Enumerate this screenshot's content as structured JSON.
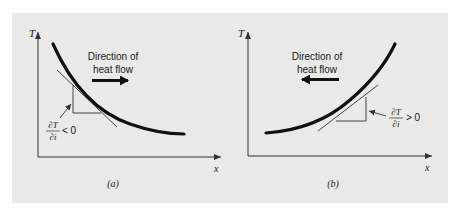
{
  "figure": {
    "background_color": "#e9e9e7",
    "curve_color": "#111111",
    "line_color": "#333333",
    "panels": [
      {
        "id": "a",
        "caption": "(a)",
        "axis_y_label": "T",
        "axis_x_label": "x",
        "direction_text_line1": "Direction of",
        "direction_text_line2": "heat flow",
        "arrow_direction": "right",
        "gradient_numerator": "∂T",
        "gradient_denominator": "∂i",
        "gradient_relation": "< 0",
        "curve_shape": "decreasing, concave up"
      },
      {
        "id": "b",
        "caption": "(b)",
        "axis_y_label": "T",
        "axis_x_label": "x",
        "direction_text_line1": "Direction of",
        "direction_text_line2": "heat flow",
        "arrow_direction": "left",
        "gradient_numerator": "∂T",
        "gradient_denominator": "∂i",
        "gradient_relation": "> 0",
        "curve_shape": "increasing, concave up"
      }
    ]
  }
}
